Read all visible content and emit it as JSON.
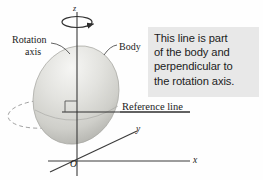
{
  "figure": {
    "title_alt": "Rigid body rotating about the z axis with a reference line",
    "background_color": "#ffffff",
    "callout": {
      "text": "This line is part of the body and perpendicular to the rotation axis.",
      "lines": [
        "This line is part",
        "of the body and",
        "perpendicular to",
        "the rotation axis."
      ],
      "background_color": "#e8e8e8",
      "text_color": "#1c1c1c"
    },
    "labels": {
      "rotation_axis_line1": "Rotation",
      "rotation_axis_line2": "axis",
      "body": "Body",
      "reference_line": "Reference line",
      "axis_z": "z",
      "axis_y": "y",
      "axis_x": "x",
      "origin": "O"
    },
    "elements": {
      "body_shape": "ellipsoid",
      "body_fill_light": "#f2f2f0",
      "body_fill_dark": "#b8b8b4",
      "axis_color": "#3a3a3a",
      "dashed_ellipse": "rotation-path",
      "right_angle_marker": "perpendicular-symbol",
      "rotation_arrow": "curved-arrow-around-z-axis"
    }
  }
}
